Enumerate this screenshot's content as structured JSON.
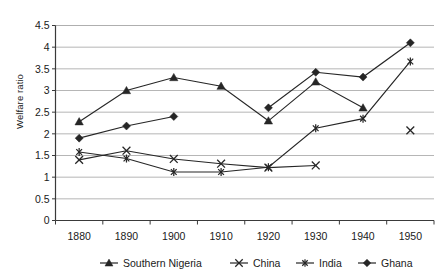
{
  "chart_data": {
    "type": "line",
    "title": "",
    "xlabel": "",
    "ylabel": "Welfare ratio",
    "x": [
      1880,
      1890,
      1900,
      1910,
      1920,
      1930,
      1940,
      1950
    ],
    "categories": [
      "1880",
      "1890",
      "1900",
      "1910",
      "1920",
      "1930",
      "1940",
      "1950"
    ],
    "ylim": [
      0,
      4.5
    ],
    "yticks": [
      0,
      0.5,
      1,
      1.5,
      2,
      2.5,
      3,
      3.5,
      4,
      4.5
    ],
    "ytick_labels": [
      "0",
      "0.5",
      "1",
      "1.5",
      "2",
      "2.5",
      "3",
      "3.5",
      "4",
      "4.5"
    ],
    "grid": true,
    "legend_position": "bottom",
    "series": [
      {
        "name": "Southern Nigeria",
        "marker": "triangle",
        "values": [
          2.28,
          3.0,
          3.3,
          3.1,
          2.3,
          3.2,
          2.6,
          null
        ]
      },
      {
        "name": "China",
        "marker": "x",
        "values": [
          1.4,
          1.61,
          1.42,
          1.31,
          1.22,
          1.27,
          null,
          2.08
        ]
      },
      {
        "name": "India",
        "marker": "asterisk",
        "values": [
          1.58,
          1.43,
          1.12,
          1.12,
          1.23,
          2.13,
          2.35,
          3.67
        ]
      },
      {
        "name": "Ghana",
        "marker": "diamond",
        "values": [
          1.9,
          2.18,
          2.4,
          null,
          2.6,
          3.42,
          3.31,
          4.1
        ]
      }
    ]
  },
  "legend": {
    "items": [
      {
        "label": "Southern Nigeria",
        "marker": "triangle"
      },
      {
        "label": "China",
        "marker": "x"
      },
      {
        "label": "India",
        "marker": "asterisk"
      },
      {
        "label": "Ghana",
        "marker": "diamond"
      }
    ]
  },
  "colors": {
    "ink": "#262626",
    "grid": "#aeaeae",
    "axis": "#3a3a3a",
    "background": "#ffffff"
  }
}
